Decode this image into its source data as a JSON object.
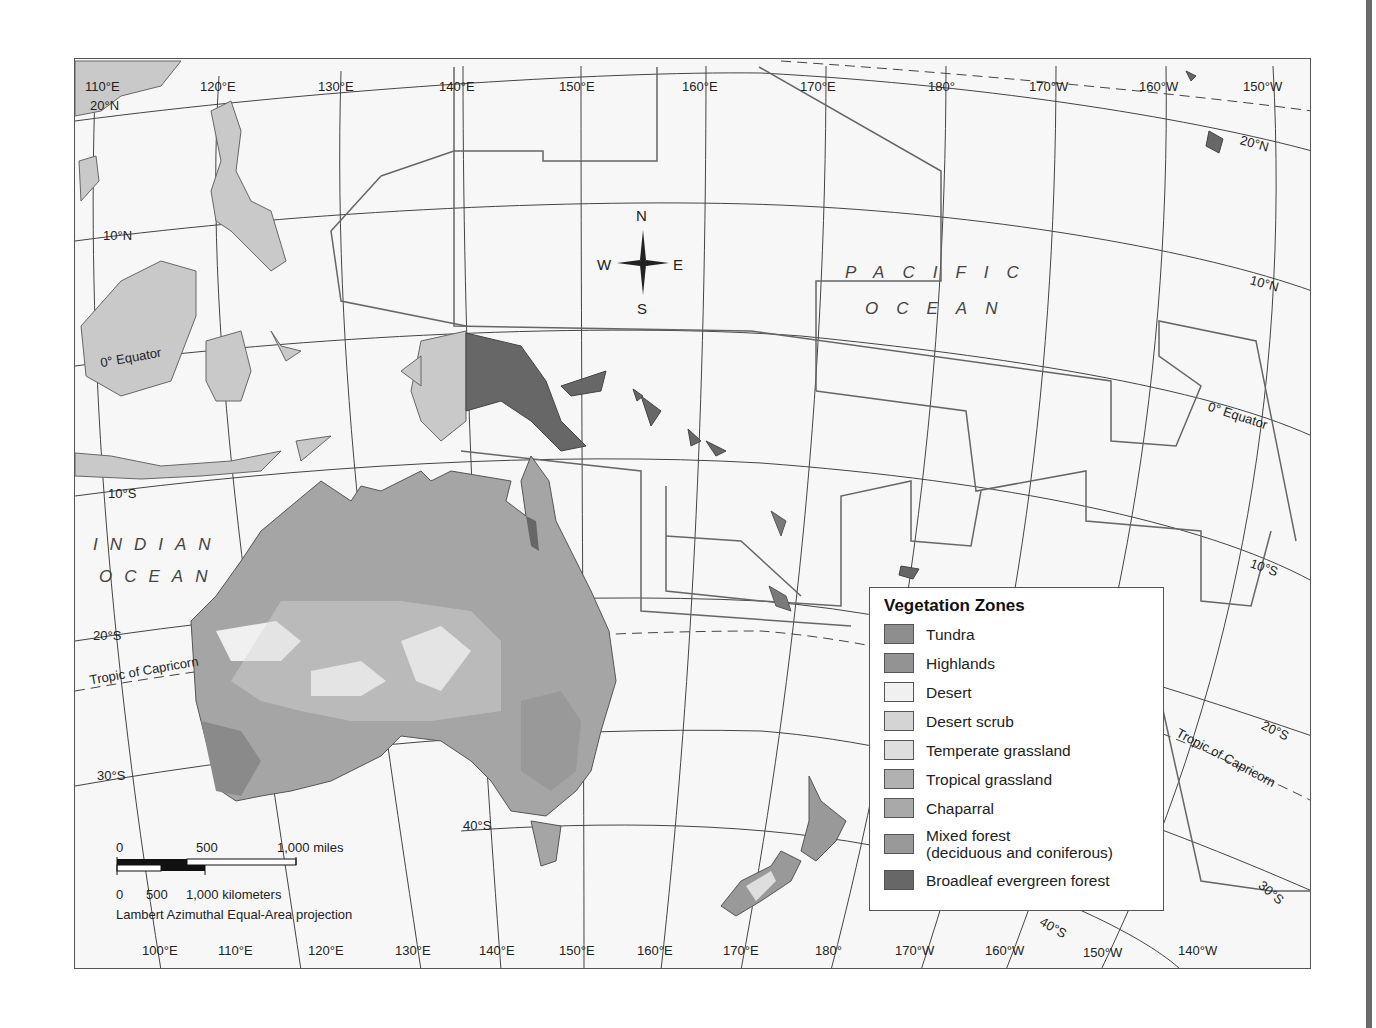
{
  "map": {
    "title": "Australia and Oceania: Vegetation Zones",
    "projection": "Lambert Azimuthal Equal-Area projection",
    "top_longitude_labels": [
      "110°E",
      "120°E",
      "130°E",
      "140°E",
      "150°E",
      "160°E",
      "170°E",
      "180°",
      "170°W",
      "160°W",
      "150°W"
    ],
    "bottom_longitude_labels": [
      "100°E",
      "110°E",
      "120°E",
      "130°E",
      "140°E",
      "150°E",
      "160°E",
      "170°E",
      "180°",
      "170°W",
      "160°W",
      "150°W",
      "140°W"
    ],
    "left_latitude_labels": [
      "20°N",
      "10°N",
      "0° Equator",
      "10°S",
      "20°S",
      "Tropic of Capricorn",
      "30°S",
      "40°S"
    ],
    "right_latitude_labels": [
      "20°N",
      "10°N",
      "0° Equator",
      "10°S",
      "20°S",
      "Tropic of Capricorn",
      "30°S",
      "40°S"
    ],
    "oceans": {
      "indian_line1": "INDIAN",
      "indian_line2": "OCEAN",
      "pacific_line1": "PACIFIC",
      "pacific_line2": "OCEAN"
    },
    "compass": {
      "n": "N",
      "s": "S",
      "e": "E",
      "w": "W"
    }
  },
  "legend": {
    "title": "Vegetation Zones",
    "items": [
      {
        "label": "Tundra",
        "color": "#8e8e8e"
      },
      {
        "label": "Highlands",
        "color": "#939393"
      },
      {
        "label": "Desert",
        "color": "#f0f0f0"
      },
      {
        "label": "Desert scrub",
        "color": "#d4d4d4"
      },
      {
        "label": "Temperate grassland",
        "color": "#dedede"
      },
      {
        "label": "Tropical grassland",
        "color": "#b1b1b1"
      },
      {
        "label": "Chaparral",
        "color": "#a9a9a9"
      },
      {
        "label": "Mixed forest",
        "label2": "(deciduous and coniferous)",
        "color": "#999999"
      },
      {
        "label": "Broadleaf evergreen forest",
        "color": "#676767"
      }
    ]
  },
  "scale_bar": {
    "miles_0": "0",
    "miles_500": "500",
    "miles_1000": "1,000 miles",
    "km_0": "0",
    "km_500": "500",
    "km_1000": "1,000 kilometers"
  }
}
